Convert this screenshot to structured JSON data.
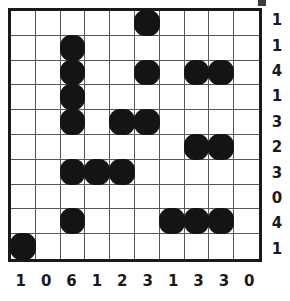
{
  "puzzle": {
    "kind": "nonogram-grid",
    "rows": 10,
    "cols": 10,
    "grid_line_color": "#58585a",
    "border_color": "#1a1a1a",
    "fill_color": "#141414",
    "background_color": "#ffffff",
    "row_clues": [
      "1",
      "1",
      "4",
      "1",
      "3",
      "2",
      "3",
      "0",
      "4",
      "1"
    ],
    "col_clues": [
      "1",
      "0",
      "6",
      "1",
      "2",
      "3",
      "1",
      "3",
      "3",
      "0"
    ],
    "cells": [
      [
        0,
        0,
        0,
        0,
        0,
        1,
        0,
        0,
        0,
        0
      ],
      [
        0,
        0,
        1,
        0,
        0,
        0,
        0,
        0,
        0,
        0
      ],
      [
        0,
        0,
        1,
        0,
        0,
        1,
        0,
        1,
        1,
        0
      ],
      [
        0,
        0,
        1,
        0,
        0,
        0,
        0,
        0,
        0,
        0
      ],
      [
        0,
        0,
        1,
        0,
        1,
        1,
        0,
        0,
        0,
        0
      ],
      [
        0,
        0,
        0,
        0,
        0,
        0,
        0,
        1,
        1,
        0
      ],
      [
        0,
        0,
        1,
        1,
        1,
        0,
        0,
        0,
        0,
        0
      ],
      [
        0,
        0,
        0,
        0,
        0,
        0,
        0,
        0,
        0,
        0
      ],
      [
        0,
        0,
        1,
        0,
        0,
        0,
        1,
        1,
        1,
        0
      ],
      [
        1,
        0,
        0,
        0,
        0,
        0,
        0,
        0,
        0,
        0
      ]
    ]
  }
}
